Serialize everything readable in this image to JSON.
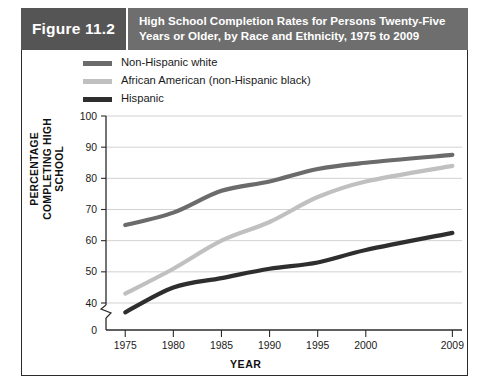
{
  "figure": {
    "tag": "Figure 11.2",
    "title": "High School Completion Rates for Persons Twenty-Five Years or Older, by Race and Ethnicity, 1975 to 2009"
  },
  "legend": {
    "position": "top-left",
    "items": [
      {
        "label": "Non-Hispanic white",
        "color": "#6b6b6b"
      },
      {
        "label": "African American (non-Hispanic black)",
        "color": "#c0c0c0"
      },
      {
        "label": "Hispanic",
        "color": "#2e2e2e"
      }
    ]
  },
  "axes": {
    "y_title_line1": "PERCENTAGE",
    "y_title_line2": "COMPLETING HIGH SCHOOL",
    "x_title": "YEAR",
    "y_ticks": [
      "0",
      "40",
      "50",
      "60",
      "70",
      "80",
      "90",
      "100"
    ],
    "x_ticks": [
      "1975",
      "1980",
      "1985",
      "1990",
      "1995",
      "2000",
      "2009"
    ],
    "axis_break": true
  },
  "colors": {
    "header_band": "#6e6e6e",
    "figure_tag": "#555555",
    "frame": "#2b2b2b",
    "gridline": "#d2d2d2"
  },
  "chart_data": {
    "type": "line",
    "title": "High School Completion Rates for Persons Twenty-Five Years or Older, by Race and Ethnicity, 1975 to 2009",
    "xlabel": "YEAR",
    "ylabel": "PERCENTAGE COMPLETING HIGH SCHOOL",
    "x": [
      1975,
      1980,
      1985,
      1990,
      1995,
      2000,
      2009
    ],
    "xlim": [
      1973,
      2010
    ],
    "ylim": [
      40,
      100
    ],
    "ybreak_at": 40,
    "grid": true,
    "legend_position": "top-left",
    "series": [
      {
        "name": "Non-Hispanic white",
        "color": "#6b6b6b",
        "values": [
          65,
          69,
          76,
          79,
          83,
          85,
          87.5
        ]
      },
      {
        "name": "African American (non-Hispanic black)",
        "color": "#c0c0c0",
        "values": [
          43,
          51,
          60,
          66,
          74,
          79,
          84
        ]
      },
      {
        "name": "Hispanic",
        "color": "#2e2e2e",
        "values": [
          37,
          45,
          48,
          51,
          53,
          57,
          62.5
        ]
      }
    ]
  }
}
